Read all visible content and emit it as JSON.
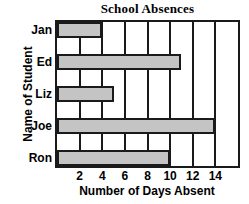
{
  "chart_data": {
    "type": "bar",
    "orientation": "horizontal",
    "title": "School Absences",
    "xlabel": "Number of Days Absent",
    "ylabel": "Name of Student",
    "categories": [
      "Jan",
      "Ed",
      "Liz",
      "Joe",
      "Ron"
    ],
    "values": [
      4,
      11,
      5,
      14,
      10
    ],
    "xlim": [
      0,
      16
    ],
    "xticks": [
      2,
      4,
      6,
      8,
      10,
      12,
      14
    ],
    "xtick_labels": [
      "2",
      "4",
      "6",
      "8",
      "10",
      "12",
      "14"
    ],
    "gridlines": true,
    "legend": null,
    "bar_color": "#c4c4c4",
    "border_color": "#1a1a1a",
    "background_color": "#ffffff"
  }
}
